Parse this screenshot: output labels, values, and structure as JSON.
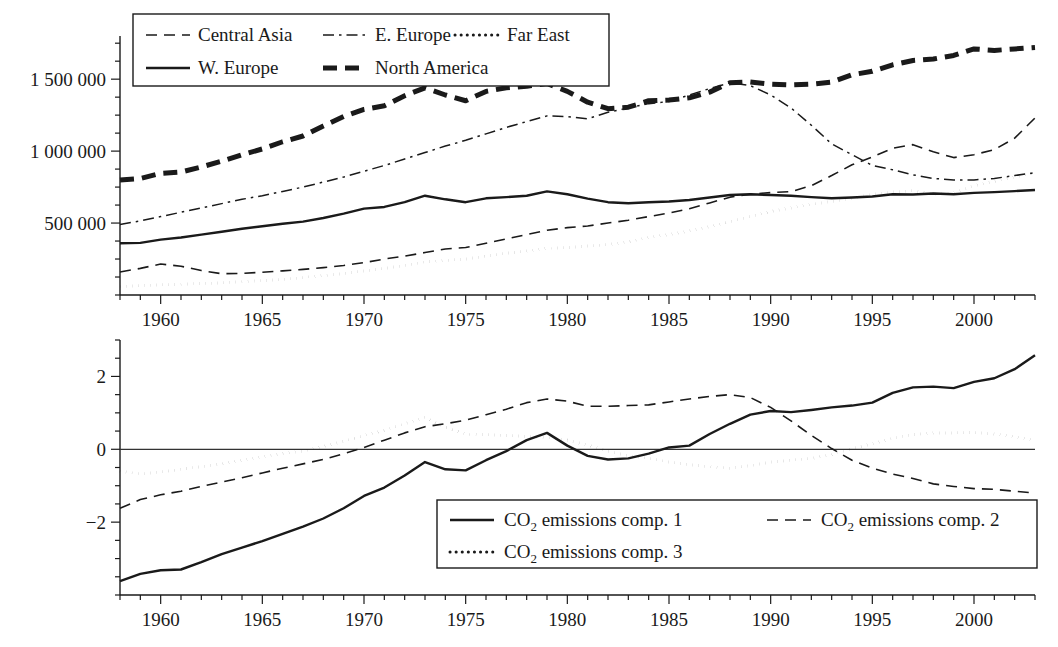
{
  "figure": {
    "background": "#ffffff",
    "ink": "#1a1a1a"
  },
  "chart_data": [
    {
      "id": "top-panel",
      "type": "line",
      "title": "",
      "xlabel": "",
      "ylabel": "",
      "xlim": [
        1958,
        2003
      ],
      "ylim": [
        0,
        1800000
      ],
      "xticks": [
        1960,
        1965,
        1970,
        1975,
        1980,
        1985,
        1990,
        1995,
        2000
      ],
      "xticklabels": [
        "1960",
        "1965",
        "1970",
        "1975",
        "1980",
        "1985",
        "1990",
        "1995",
        "2000"
      ],
      "yticks": [
        500000,
        1000000,
        1500000
      ],
      "yticklabels": [
        "500 000",
        "1 000 000",
        "1 500 000"
      ],
      "minor_ticks": true,
      "grid": false,
      "legend_position": "top-left",
      "x": [
        1958,
        1959,
        1960,
        1961,
        1962,
        1963,
        1964,
        1965,
        1966,
        1967,
        1968,
        1969,
        1970,
        1971,
        1972,
        1973,
        1974,
        1975,
        1976,
        1977,
        1978,
        1979,
        1980,
        1981,
        1982,
        1983,
        1984,
        1985,
        1986,
        1987,
        1988,
        1989,
        1990,
        1991,
        1992,
        1993,
        1994,
        1995,
        1996,
        1997,
        1998,
        1999,
        2000,
        2001,
        2002,
        2003
      ],
      "series": [
        {
          "name": "Central Asia",
          "style": "dashed",
          "values": [
            160000,
            185000,
            215000,
            200000,
            170000,
            148000,
            150000,
            158000,
            168000,
            178000,
            190000,
            205000,
            225000,
            250000,
            270000,
            295000,
            320000,
            330000,
            360000,
            390000,
            420000,
            450000,
            468000,
            480000,
            500000,
            520000,
            545000,
            570000,
            600000,
            640000,
            680000,
            700000,
            712000,
            718000,
            760000,
            830000,
            905000,
            960000,
            1020000,
            1045000,
            995000,
            955000,
            975000,
            1010000,
            1090000,
            1230000
          ]
        },
        {
          "name": "E. Europe",
          "style": "dashdot",
          "values": [
            490000,
            515000,
            545000,
            575000,
            605000,
            635000,
            665000,
            690000,
            720000,
            750000,
            785000,
            820000,
            860000,
            900000,
            945000,
            990000,
            1035000,
            1075000,
            1120000,
            1165000,
            1205000,
            1245000,
            1240000,
            1225000,
            1270000,
            1300000,
            1330000,
            1345000,
            1390000,
            1435000,
            1475000,
            1455000,
            1390000,
            1300000,
            1180000,
            1050000,
            975000,
            900000,
            870000,
            835000,
            810000,
            800000,
            800000,
            810000,
            830000,
            850000
          ]
        },
        {
          "name": "Far East",
          "style": "dotted",
          "values": [
            60000,
            65000,
            70000,
            75000,
            80000,
            85000,
            92000,
            100000,
            108000,
            120000,
            135000,
            150000,
            168000,
            185000,
            205000,
            230000,
            240000,
            250000,
            270000,
            290000,
            305000,
            325000,
            330000,
            340000,
            350000,
            370000,
            400000,
            420000,
            445000,
            475000,
            510000,
            545000,
            580000,
            605000,
            630000,
            650000,
            672000,
            700000,
            715000,
            725000,
            700000,
            710000,
            760000,
            790000,
            820000,
            850000
          ]
        },
        {
          "name": "W. Europe",
          "style": "solid",
          "values": [
            360000,
            362000,
            385000,
            400000,
            420000,
            440000,
            460000,
            478000,
            495000,
            510000,
            535000,
            565000,
            600000,
            612000,
            645000,
            690000,
            665000,
            645000,
            672000,
            680000,
            690000,
            720000,
            700000,
            670000,
            645000,
            638000,
            645000,
            650000,
            660000,
            678000,
            695000,
            700000,
            695000,
            690000,
            680000,
            672000,
            678000,
            685000,
            700000,
            698000,
            705000,
            700000,
            710000,
            715000,
            722000,
            730000
          ]
        },
        {
          "name": "North America",
          "style": "thickdashed",
          "values": [
            800000,
            810000,
            845000,
            855000,
            890000,
            930000,
            975000,
            1015000,
            1065000,
            1105000,
            1175000,
            1240000,
            1290000,
            1315000,
            1385000,
            1440000,
            1390000,
            1350000,
            1415000,
            1440000,
            1450000,
            1470000,
            1415000,
            1340000,
            1295000,
            1305000,
            1350000,
            1355000,
            1370000,
            1410000,
            1475000,
            1480000,
            1465000,
            1460000,
            1465000,
            1480000,
            1530000,
            1555000,
            1600000,
            1630000,
            1640000,
            1665000,
            1710000,
            1700000,
            1710000,
            1720000
          ]
        }
      ]
    },
    {
      "id": "bottom-panel",
      "type": "line",
      "title": "",
      "xlabel": "",
      "ylabel": "",
      "xlim": [
        1958,
        2003
      ],
      "ylim": [
        -4.0,
        3.0
      ],
      "xticks": [
        1960,
        1965,
        1970,
        1975,
        1980,
        1985,
        1990,
        1995,
        2000
      ],
      "xticklabels": [
        "1960",
        "1965",
        "1970",
        "1975",
        "1980",
        "1985",
        "1990",
        "1995",
        "2000"
      ],
      "yticks": [
        -2,
        0,
        2
      ],
      "yticklabels": [
        "−2",
        "0",
        "2"
      ],
      "minor_ticks": true,
      "grid": false,
      "zero_line": true,
      "legend_position": "bottom-right",
      "x": [
        1958,
        1959,
        1960,
        1961,
        1962,
        1963,
        1964,
        1965,
        1966,
        1967,
        1968,
        1969,
        1970,
        1971,
        1972,
        1973,
        1974,
        1975,
        1976,
        1977,
        1978,
        1979,
        1980,
        1981,
        1982,
        1983,
        1984,
        1985,
        1986,
        1987,
        1988,
        1989,
        1990,
        1991,
        1992,
        1993,
        1994,
        1995,
        1996,
        1997,
        1998,
        1999,
        2000,
        2001,
        2002,
        2003
      ],
      "series": [
        {
          "name": "CO₂ emissions comp. 1",
          "style": "solid",
          "values": [
            -3.62,
            -3.42,
            -3.32,
            -3.3,
            -3.1,
            -2.88,
            -2.7,
            -2.52,
            -2.32,
            -2.12,
            -1.9,
            -1.62,
            -1.28,
            -1.05,
            -0.72,
            -0.35,
            -0.55,
            -0.58,
            -0.3,
            -0.05,
            0.25,
            0.45,
            0.1,
            -0.18,
            -0.28,
            -0.25,
            -0.12,
            0.05,
            0.1,
            0.42,
            0.7,
            0.95,
            1.05,
            1.02,
            1.08,
            1.15,
            1.2,
            1.28,
            1.55,
            1.7,
            1.72,
            1.68,
            1.85,
            1.95,
            2.2,
            2.58
          ]
        },
        {
          "name": "CO₂ emissions comp. 2",
          "style": "dashed",
          "values": [
            -1.62,
            -1.38,
            -1.25,
            -1.15,
            -1.02,
            -0.9,
            -0.78,
            -0.65,
            -0.52,
            -0.4,
            -0.28,
            -0.12,
            0.05,
            0.25,
            0.45,
            0.62,
            0.7,
            0.8,
            0.95,
            1.1,
            1.28,
            1.38,
            1.32,
            1.18,
            1.18,
            1.2,
            1.22,
            1.3,
            1.38,
            1.45,
            1.5,
            1.42,
            1.15,
            0.78,
            0.38,
            0.02,
            -0.3,
            -0.52,
            -0.68,
            -0.8,
            -0.95,
            -1.02,
            -1.08,
            -1.1,
            -1.15,
            -1.2
          ]
        },
        {
          "name": "CO₂ emissions comp. 3",
          "style": "dotted",
          "values": [
            -0.6,
            -0.68,
            -0.62,
            -0.55,
            -0.48,
            -0.4,
            -0.3,
            -0.2,
            -0.12,
            -0.05,
            0.08,
            0.22,
            0.38,
            0.52,
            0.7,
            0.88,
            0.6,
            0.42,
            0.4,
            0.38,
            0.35,
            0.32,
            0.25,
            0.12,
            -0.05,
            -0.18,
            -0.25,
            -0.35,
            -0.42,
            -0.48,
            -0.52,
            -0.45,
            -0.35,
            -0.3,
            -0.25,
            -0.15,
            0.02,
            0.15,
            0.3,
            0.4,
            0.45,
            0.45,
            0.46,
            0.42,
            0.35,
            0.25
          ]
        }
      ]
    }
  ],
  "legends": {
    "top": {
      "rows": [
        [
          {
            "label": "Central Asia",
            "style": "dashed"
          },
          {
            "label": "E. Europe",
            "style": "dashdot"
          },
          {
            "label": "Far East",
            "style": "dotted"
          }
        ],
        [
          {
            "label": "W. Europe",
            "style": "solid"
          },
          {
            "label": "North America",
            "style": "thickdashed"
          }
        ]
      ]
    },
    "bottom": {
      "rows": [
        [
          {
            "label": "CO2 emissions comp. 1",
            "base": "CO",
            "sub": "2",
            "tail": " emissions comp. 1",
            "style": "solid"
          },
          {
            "label": "CO2 emissions comp. 2",
            "base": "CO",
            "sub": "2",
            "tail": " emissions comp. 2",
            "style": "dashed"
          }
        ],
        [
          {
            "label": "CO2 emissions comp. 3",
            "base": "CO",
            "sub": "2",
            "tail": " emissions comp. 3",
            "style": "dotted"
          }
        ]
      ]
    }
  }
}
